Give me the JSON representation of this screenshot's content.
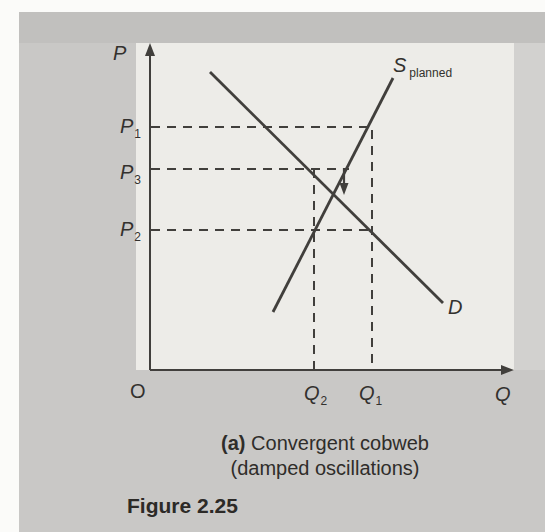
{
  "figure_label": "Figure 2.25",
  "caption": {
    "tag": "(a)",
    "line1": "Convergent cobweb",
    "line2": "(damped oscillations)"
  },
  "labels": {
    "y_axis": "P",
    "x_axis": "Q",
    "origin": "O",
    "p1": {
      "base": "P",
      "sub": "1"
    },
    "p3": {
      "base": "P",
      "sub": "3"
    },
    "p2": {
      "base": "P",
      "sub": "2"
    },
    "q2": {
      "base": "Q",
      "sub": "2"
    },
    "q1": {
      "base": "Q",
      "sub": "1"
    },
    "supply": {
      "base": "S",
      "sub": "planned"
    },
    "demand": "D"
  },
  "colors": {
    "page_margin": "#fbfbf9",
    "page_panel": "#c9c8c6",
    "top_band": "#c1c0be",
    "plot_area": "#edece8",
    "right_band": "#d2d1cf",
    "line": "#413f3c",
    "text": "#33312e"
  },
  "chart_data": {
    "type": "line",
    "title": "(a) Convergent cobweb (damped oscillations)",
    "xlabel": "Q",
    "ylabel": "P",
    "x_range": [
      0,
      100
    ],
    "y_range": [
      0,
      100
    ],
    "grid": false,
    "legend": "inline curve labels",
    "series": [
      {
        "name": "S planned",
        "role": "supply",
        "points": [
          [
            34,
            18
          ],
          [
            67,
            90
          ]
        ]
      },
      {
        "name": "D",
        "role": "demand",
        "points": [
          [
            16,
            91
          ],
          [
            81,
            21
          ]
        ]
      }
    ],
    "reference_levels": {
      "P1": 74,
      "P3": 62,
      "P2": 43,
      "Q2": 45,
      "Q1": 61
    },
    "equilibrium": {
      "Q": 51,
      "P": 54
    },
    "annotations": [
      "dashed horizontal guide lines at P1, P3 and P2 from the P axis",
      "dashed vertical guide lines at Q2 (up to P3) and Q1 (up to P1)",
      "small solid downward arrow just above the S/D intersection showing damped convergence"
    ]
  },
  "diagram": {
    "stroke": "#413f3c",
    "dash_pattern": "9 7",
    "solid_lines": [
      {
        "name": "y-axis",
        "x1": 150,
        "y1": 370,
        "x2": 150,
        "y2": 54,
        "w": 2
      },
      {
        "name": "x-axis",
        "x1": 150,
        "y1": 370,
        "x2": 503,
        "y2": 370,
        "w": 2
      },
      {
        "name": "demand-curve",
        "x1": 210,
        "y1": 72,
        "x2": 443,
        "y2": 303,
        "w": 2.8
      },
      {
        "name": "supply-curve",
        "x1": 273,
        "y1": 312,
        "x2": 393,
        "y2": 78,
        "w": 2.8
      },
      {
        "name": "cobweb-arrow-stem",
        "x1": 344,
        "y1": 168,
        "x2": 344,
        "y2": 184,
        "w": 2.2
      }
    ],
    "dashed_lines": [
      {
        "name": "p1-dash",
        "x1": 151,
        "y1": 127,
        "x2": 370,
        "y2": 127,
        "w": 2
      },
      {
        "name": "p3-dash",
        "x1": 151,
        "y1": 169,
        "x2": 349,
        "y2": 169,
        "w": 2
      },
      {
        "name": "p2-dash",
        "x1": 151,
        "y1": 230,
        "x2": 372,
        "y2": 230,
        "w": 2
      },
      {
        "name": "q2-dash",
        "x1": 314,
        "y1": 169,
        "x2": 314,
        "y2": 369,
        "w": 2
      },
      {
        "name": "q1-dash",
        "x1": 372,
        "y1": 130,
        "x2": 372,
        "y2": 369,
        "w": 2
      }
    ],
    "arrowheads": [
      {
        "name": "y-axis-arrowhead",
        "points": "150,43 145,56 155,56"
      },
      {
        "name": "x-axis-arrowhead",
        "points": "514,370 501,365 501,375"
      },
      {
        "name": "cobweb-arrowhead",
        "points": "339.5,183 348.5,183 344,195"
      }
    ]
  }
}
